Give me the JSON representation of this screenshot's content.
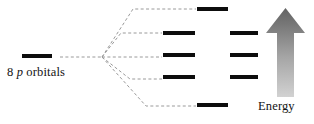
{
  "figure": {
    "type": "energy-level-splitting-diagram",
    "width": 314,
    "height": 124,
    "background_color": "#ffffff"
  },
  "labels": {
    "source_prefix": "8 ",
    "source_orbital_letter": "p",
    "source_suffix": " orbitals",
    "source_full": "8 p orbitals",
    "energy_axis": "Energy"
  },
  "colors": {
    "level_bar": "#0d0d0d",
    "correlation_line": "#9a9a9a",
    "arrow_top": "#6a6a6a",
    "arrow_bottom": "#cdcdcd",
    "text": "#131313",
    "background": "#ffffff"
  },
  "chart_data": {
    "type": "diagram",
    "title": "",
    "source_level": {
      "label": "8 p orbitals",
      "degeneracy": 8,
      "x1": 22,
      "x2": 52,
      "y": 56
    },
    "fan_origin": {
      "x": 102,
      "y": 57
    },
    "split_levels": [
      {
        "index": 1,
        "x1": 197,
        "x2": 228,
        "y": 9,
        "column": "outer",
        "relative_energy": "highest"
      },
      {
        "index": 2,
        "x1": 163,
        "x2": 195,
        "y": 33,
        "column": "inner",
        "relative_energy": "high"
      },
      {
        "index": 3,
        "x1": 230,
        "x2": 258,
        "y": 33,
        "column": "outer",
        "relative_energy": "high"
      },
      {
        "index": 4,
        "x1": 163,
        "x2": 195,
        "y": 55,
        "column": "inner",
        "relative_energy": "middle"
      },
      {
        "index": 5,
        "x1": 230,
        "x2": 258,
        "y": 55,
        "column": "outer",
        "relative_energy": "middle"
      },
      {
        "index": 6,
        "x1": 163,
        "x2": 195,
        "y": 77,
        "column": "inner",
        "relative_energy": "low"
      },
      {
        "index": 7,
        "x1": 230,
        "x2": 258,
        "y": 77,
        "column": "outer",
        "relative_energy": "low"
      },
      {
        "index": 8,
        "x1": 197,
        "x2": 228,
        "y": 105,
        "column": "outer",
        "relative_energy": "lowest"
      }
    ],
    "correlation_paths": [
      {
        "index": 1,
        "direction": "up",
        "elbow_x": 133,
        "end_x": 196,
        "end_y": 9
      },
      {
        "index": 2,
        "direction": "up",
        "elbow_x": 121,
        "end_x": 162,
        "end_y": 33
      },
      {
        "index": 3,
        "direction": "horizontal",
        "elbow_x": 110,
        "end_x": 162,
        "end_y": 57
      },
      {
        "index": 4,
        "direction": "down",
        "elbow_x": 130,
        "end_x": 162,
        "end_y": 79
      },
      {
        "index": 5,
        "direction": "down",
        "elbow_x": 146,
        "end_x": 196,
        "end_y": 106
      }
    ],
    "energy_arrow": {
      "label": "Energy",
      "direction": "up",
      "apex_y": 8,
      "base_y": 97,
      "shaft_x1": 277,
      "shaft_x2": 294,
      "head_x1": 266,
      "head_x2": 305,
      "head_base_y": 33,
      "gradient_from": "#6a6a6a",
      "gradient_to": "#cdcdcd"
    },
    "legend": [],
    "grid": false
  }
}
